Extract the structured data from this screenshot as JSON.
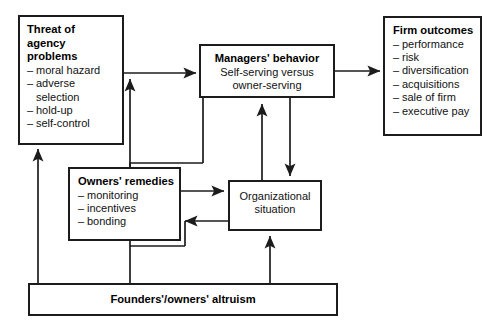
{
  "diagram": {
    "nodes": {
      "threat": {
        "title_lines": [
          "Threat of",
          "agency",
          "problems"
        ],
        "items": [
          "moral hazard",
          "adverse",
          "selection",
          "hold-up",
          "self-control"
        ],
        "continuation_indices": [
          2
        ]
      },
      "managers": {
        "title": "Managers' behavior",
        "sub_lines": [
          "Self-serving versus",
          "owner-serving"
        ]
      },
      "outcomes": {
        "title": "Firm outcomes",
        "items": [
          "performance",
          "risk",
          "diversification",
          "acquisitions",
          "sale of firm",
          "executive pay"
        ]
      },
      "remedies": {
        "title": "Owners' remedies",
        "items": [
          "monitoring",
          "incentives",
          "bonding"
        ]
      },
      "orgsit": {
        "title_lines": [
          "Organizational",
          "situation"
        ]
      },
      "altruism": {
        "title": "Founders'/owners' altruism"
      }
    },
    "bullet_dash": "–",
    "colors": {
      "stroke": "#1c1c1c",
      "text": "#000000",
      "background": "#ffffff"
    },
    "connectors": [
      {
        "name": "threat-to-managers",
        "from": "threat",
        "to": "managers",
        "style": "arrow"
      },
      {
        "name": "managers-to-outcomes",
        "from": "managers",
        "to": "outcomes",
        "style": "arrow"
      },
      {
        "name": "remedies-to-threat-path",
        "from": "remedies",
        "to": "threat-to-managers-line",
        "style": "arrow"
      },
      {
        "name": "managers-to-orgsit",
        "from": "managers",
        "to": "orgsit",
        "style": "arrow"
      },
      {
        "name": "orgsit-to-managers",
        "from": "orgsit",
        "to": "managers",
        "style": "arrow"
      },
      {
        "name": "remedies-to-orgsit",
        "from": "remedies",
        "to": "orgsit",
        "style": "arrow"
      },
      {
        "name": "orgsit-to-remedies",
        "from": "orgsit",
        "to": "remedies",
        "style": "arrow"
      },
      {
        "name": "managers-to-remedies",
        "from": "managers",
        "to": "remedies",
        "style": "line"
      },
      {
        "name": "altruism-to-threat",
        "from": "altruism",
        "to": "threat",
        "style": "arrow"
      },
      {
        "name": "altruism-to-remedies",
        "from": "altruism",
        "to": "remedies",
        "style": "arrow"
      },
      {
        "name": "altruism-to-orgsit",
        "from": "altruism",
        "to": "orgsit",
        "style": "arrow"
      }
    ]
  }
}
